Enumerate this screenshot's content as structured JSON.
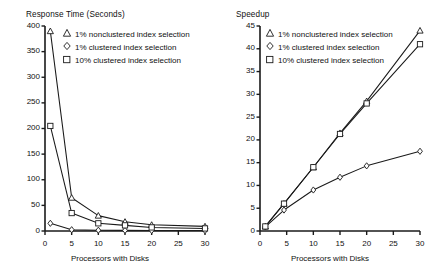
{
  "figure": {
    "width": 440,
    "height": 277,
    "background": "#ffffff",
    "ink": "#1a1a1a"
  },
  "chart_data": [
    {
      "type": "line",
      "panel": "left",
      "title": "Response Time (Seconds)",
      "xlabel": "Processors with Disks",
      "ylabel": "Response Time (Seconds)",
      "xlim": [
        0,
        30
      ],
      "ylim": [
        0,
        400
      ],
      "xticks": [
        0,
        5,
        10,
        15,
        20,
        25,
        30
      ],
      "yticks": [
        0,
        50,
        100,
        150,
        200,
        250,
        300,
        350,
        400
      ],
      "xticklabels": [
        "0",
        "5",
        "10",
        "15",
        "20",
        "25",
        "30"
      ],
      "yticklabels": [
        "0",
        "50",
        "100",
        "150",
        "200",
        "250",
        "300",
        "350",
        "400"
      ],
      "grid": false,
      "legend_position": "upper right",
      "series": [
        {
          "name": "1% nonclustered index selection",
          "marker": "triangle",
          "x": [
            1,
            5,
            10,
            15,
            20,
            30
          ],
          "values": [
            390,
            65,
            30,
            18,
            12,
            9
          ]
        },
        {
          "name": "1% clustered index selection",
          "marker": "diamond",
          "x": [
            1,
            5,
            10,
            15,
            20,
            30
          ],
          "values": [
            15,
            2.5,
            1.5,
            1.2,
            1.0,
            0.8
          ]
        },
        {
          "name": "10% clustered index selection",
          "marker": "square",
          "x": [
            1,
            5,
            10,
            15,
            20,
            30
          ],
          "values": [
            205,
            35,
            15,
            11,
            7,
            5
          ]
        }
      ]
    },
    {
      "type": "line",
      "panel": "right",
      "title": "Speedup",
      "xlabel": "Processors with Disks",
      "ylabel": "Speedup",
      "xlim": [
        0,
        30
      ],
      "ylim": [
        0,
        45
      ],
      "xticks": [
        0,
        5,
        10,
        15,
        20,
        25,
        30
      ],
      "yticks": [
        0,
        5,
        10,
        15,
        20,
        25,
        30,
        35,
        40,
        45
      ],
      "xticklabels": [
        "0",
        "5",
        "10",
        "15",
        "20",
        "25",
        "30"
      ],
      "yticklabels": [
        "0",
        "5",
        "10",
        "15",
        "20",
        "25",
        "30",
        "35",
        "40",
        "45"
      ],
      "grid": false,
      "legend_position": "upper left",
      "series": [
        {
          "name": "1% nonclustered index selection",
          "marker": "triangle",
          "x": [
            1,
            4.5,
            10,
            15,
            20,
            30
          ],
          "values": [
            1,
            6,
            14,
            21.5,
            28.5,
            44
          ]
        },
        {
          "name": "1% clustered index selection",
          "marker": "diamond",
          "x": [
            1,
            4.5,
            10,
            15,
            20,
            30
          ],
          "values": [
            0.9,
            4.6,
            9,
            11.8,
            14.3,
            17.5
          ]
        },
        {
          "name": "10% clustered index selection",
          "marker": "square",
          "x": [
            1,
            4.5,
            10,
            15,
            20,
            30
          ],
          "values": [
            1,
            6,
            14,
            21.3,
            28,
            41
          ]
        }
      ]
    }
  ],
  "legend_entries": [
    {
      "marker": "triangle",
      "label": "1% nonclustered index selection"
    },
    {
      "marker": "diamond",
      "label": "1% clustered index selection"
    },
    {
      "marker": "square",
      "label": "10% clustered index selection"
    }
  ]
}
